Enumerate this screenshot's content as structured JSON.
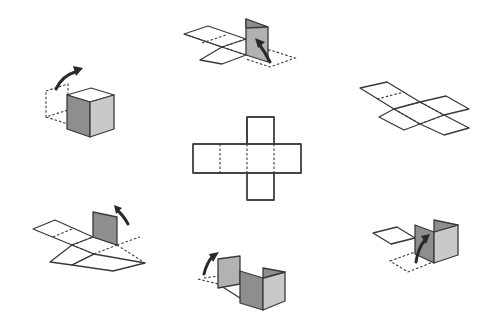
{
  "diagram": {
    "title": "",
    "colors": {
      "background": "#ffffff",
      "line": "#3a3a3a",
      "face_dark": "#8e8e8e",
      "face_mid": "#b2b2b2",
      "face_light": "#c9c9c9",
      "arrow": "#2a2a2a"
    },
    "center_net": {
      "label": "",
      "shape": "cross (6 squares)",
      "fold_lines": "dotted"
    },
    "stages": [
      {
        "position": "top",
        "state": "one face folded up, arrow lifting it"
      },
      {
        "position": "top-right",
        "state": "flat net in isometric view"
      },
      {
        "position": "bottom-right",
        "state": "two faces folded up, arrow lifting third"
      },
      {
        "position": "bottom",
        "state": "U-shaped sleeve of three faces, arrow lifting next"
      },
      {
        "position": "bottom-left",
        "state": "one face raised, arrow lifting"
      },
      {
        "position": "top-left",
        "state": "closed cube with lid being folded, arrow"
      }
    ]
  }
}
